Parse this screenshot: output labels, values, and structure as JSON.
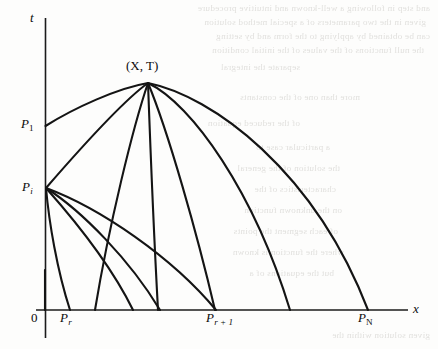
{
  "figure": {
    "caption": "",
    "background_color": "#fdfdfc",
    "ink_color": "#141414"
  },
  "axes": {
    "t_axis_label": "t",
    "x_axis_label": "x",
    "origin_label": "0"
  },
  "labels": {
    "apex": "(X, T)",
    "apex_x_symbol": "X",
    "apex_t_symbol": "T",
    "p1_base": "P",
    "p1_sub": "1",
    "pi_base": "P",
    "pi_sub": "i",
    "pr_base": "P",
    "pr_sub": "r",
    "pr1_base": "P",
    "pr1_sub": "r + 1",
    "pn_base": "P",
    "pn_sub": "N"
  },
  "chart_data": {
    "type": "line",
    "title": "",
    "xlabel": "x",
    "ylabel": "t",
    "grid": false,
    "legend": "none",
    "xlim": [
      0,
      408
    ],
    "ylim": [
      0,
      310
    ],
    "annotations": [
      {
        "text": "(X, T)",
        "x": 148,
        "y": 83
      },
      {
        "text": "P1",
        "x": 45,
        "y": 126
      },
      {
        "text": "Pi",
        "x": 45,
        "y": 188
      },
      {
        "text": "Pr",
        "x": 70,
        "y": 310
      },
      {
        "text": "Pr+1",
        "x": 215,
        "y": 310
      },
      {
        "text": "PN",
        "x": 368,
        "y": 310
      }
    ],
    "apex": {
      "x": 148,
      "y": 83
    },
    "t_axis_points": [
      {
        "name": "P1",
        "x": 45,
        "y": 126
      },
      {
        "name": "Pi",
        "x": 45,
        "y": 188
      }
    ],
    "x_axis_points": [
      {
        "name": "Pr",
        "x": 70,
        "y": 310
      },
      {
        "name": "",
        "x": 95,
        "y": 310
      },
      {
        "name": "",
        "x": 133,
        "y": 310
      },
      {
        "name": "",
        "x": 158,
        "y": 310
      },
      {
        "name": "Pr+1",
        "x": 215,
        "y": 310
      },
      {
        "name": "",
        "x": 290,
        "y": 310
      },
      {
        "name": "PN",
        "x": 368,
        "y": 310
      }
    ],
    "series": [
      {
        "name": "apex-to-P1",
        "path": "M 148 83 C 118 88 74 108 45.5 126"
      },
      {
        "name": "apex-to-Pi",
        "path": "M 148 83 C 120 103 72 158 46 188"
      },
      {
        "name": "apex-to-x-95",
        "path": "M 148 83 C 133 127 109 225 95 310"
      },
      {
        "name": "apex-to-x-158",
        "path": "M 148 83 C 150 138 154 237 158 310"
      },
      {
        "name": "apex-to-x-215",
        "path": "M 148 83 C 168 131 197 233 215 310"
      },
      {
        "name": "apex-to-x-290",
        "path": "M 148 83 C 192 104 254 192 290 310"
      },
      {
        "name": "apex-to-x-368",
        "path": "M 148 83 C 212 96 314 170 368 310"
      },
      {
        "name": "Pi-to-x-70",
        "path": "M 46 188 C 49 222 57 270 70 310"
      },
      {
        "name": "Pi-to-x-133",
        "path": "M 46 188 C 70 215 110 263 133 310"
      },
      {
        "name": "Pi-to-x-158b",
        "path": "M 46 188 C 82 211 130 260 160 310"
      },
      {
        "name": "Pi-to-x-215b",
        "path": "M 46 188 C 100 208 172 257 216 310"
      },
      {
        "name": "short-stub-left",
        "path": "M 45 270 C 45 270 45 290 45 310"
      }
    ]
  },
  "bleed_text": {
    "lines": [
      "and step in following a well-known and intuitive procedure",
      "given in the two parameters of a special method solution",
      "can be obtained by applying to the form and by setting",
      "the null functions of the values of the initial condition",
      "separate the integral",
      "more than one of the constants",
      "of the reduced equation",
      "a particular case to",
      "the solution of the general",
      "characteristics of the",
      "on the unknown function",
      "of each segment the points",
      "where the function is known",
      "but the equations of a",
      "given solution within the"
    ]
  }
}
